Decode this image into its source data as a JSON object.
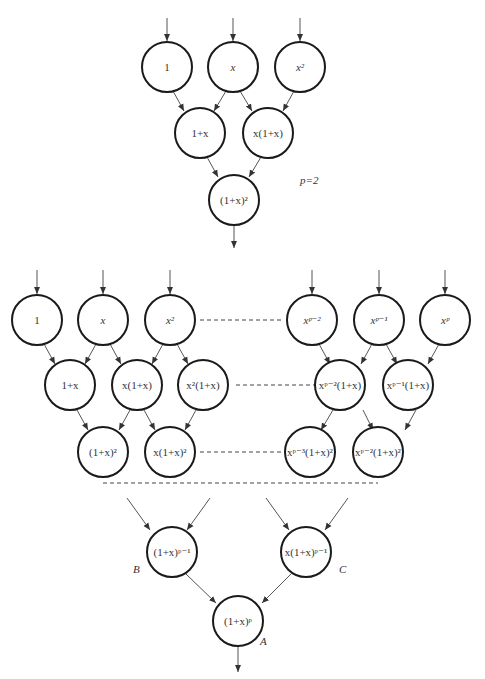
{
  "diagram": {
    "top": {
      "label": "p=2",
      "nodes": [
        {
          "id": "t1",
          "text": "1",
          "cx": 167,
          "cy": 67
        },
        {
          "id": "t2",
          "text": "x",
          "cx": 233,
          "cy": 67
        },
        {
          "id": "t3",
          "text": "x²",
          "cx": 300,
          "cy": 67
        },
        {
          "id": "t4",
          "text": "1+x",
          "cx": 200,
          "cy": 133
        },
        {
          "id": "t5",
          "text": "x(1+x)",
          "cx": 268,
          "cy": 133
        },
        {
          "id": "t6",
          "text": "(1+x)²",
          "cx": 234,
          "cy": 200
        }
      ]
    },
    "general": {
      "row1": [
        {
          "text": "1",
          "cx": 37,
          "cy": 320
        },
        {
          "text": "x",
          "cx": 103,
          "cy": 320
        },
        {
          "text": "x²",
          "cx": 170,
          "cy": 320
        },
        {
          "text": "xᵖ⁻²",
          "cx": 328,
          "cy": 320
        },
        {
          "text": "xᵖ⁻¹",
          "cx": 395,
          "cy": 320
        },
        {
          "text": "xᵖ",
          "cx": 461,
          "cy": 320
        }
      ],
      "row2": [
        {
          "text": "1+x",
          "cx": 70,
          "cy": 385
        },
        {
          "text": "x(1+x)",
          "cx": 137,
          "cy": 385
        },
        {
          "text": "x²(1+x)",
          "cx": 203,
          "cy": 385
        },
        {
          "text": "xᵖ⁻²(1+x)",
          "cx": 356,
          "cy": 385
        },
        {
          "text": "xᵖ⁻¹(1+x)",
          "cx": 423,
          "cy": 385
        }
      ],
      "row3": [
        {
          "text": "(1+x)²",
          "cx": 103,
          "cy": 452
        },
        {
          "text": "x(1+x)²",
          "cx": 170,
          "cy": 452
        },
        {
          "text": "xᵖ⁻³(1+x)²",
          "cx": 312,
          "cy": 452
        },
        {
          "text": "xᵖ⁻²(1+x)²",
          "cx": 379,
          "cy": 452
        }
      ]
    },
    "bottom": {
      "B": {
        "text": "(1+x)ᵖ⁻¹",
        "cx": 172,
        "cy": 552,
        "letter": "B"
      },
      "C": {
        "text": "x(1+x)ᵖ⁻¹",
        "cx": 306,
        "cy": 552,
        "letter": "C"
      },
      "A": {
        "text": "(1+x)ᵖ",
        "cx": 238,
        "cy": 621,
        "letter": "A"
      }
    }
  }
}
